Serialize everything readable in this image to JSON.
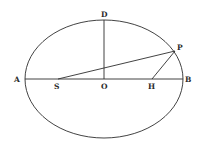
{
  "diagram": {
    "type": "ellipse-geometry",
    "ellipse": {
      "cx": 104,
      "cy": 79,
      "rx": 79,
      "ry": 59
    },
    "points": {
      "A": {
        "label": "A",
        "x": 25,
        "y": 79
      },
      "B": {
        "label": "B",
        "x": 183,
        "y": 79
      },
      "D": {
        "label": "D",
        "x": 104,
        "y": 20
      },
      "O": {
        "label": "O",
        "x": 104,
        "y": 79
      },
      "S": {
        "label": "S",
        "x": 58,
        "y": 79
      },
      "H": {
        "label": "H",
        "x": 152,
        "y": 79
      },
      "P": {
        "label": "P",
        "x": 175,
        "y": 51
      }
    },
    "segments": [
      {
        "from": "A",
        "to": "B",
        "name": "major-axis"
      },
      {
        "from": "D",
        "to": "O",
        "name": "semi-minor-axis"
      },
      {
        "from": "S",
        "to": "P",
        "name": "focal-radius-sp"
      },
      {
        "from": "H",
        "to": "P",
        "name": "focal-radius-hp"
      }
    ]
  }
}
